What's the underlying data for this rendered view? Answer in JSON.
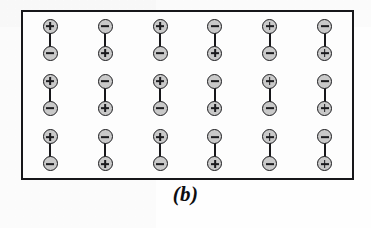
{
  "figure": {
    "caption": "(b)",
    "slab": {
      "border_color": "#17171a",
      "fill_color": "#fdfdfd"
    },
    "charge_style": {
      "fill_color": "#c9c9c9",
      "outline_color": "#1b1b1e",
      "plus_symbol": "+",
      "minus_symbol": "-"
    },
    "grid": {
      "columns": 6,
      "rows": 3
    },
    "dipole_rows": [
      [
        {
          "top": "plus",
          "bottom": "minus"
        },
        {
          "top": "minus",
          "bottom": "plus"
        },
        {
          "top": "plus",
          "bottom": "minus"
        },
        {
          "top": "minus",
          "bottom": "plus"
        },
        {
          "top": "plus",
          "bottom": "minus"
        },
        {
          "top": "minus",
          "bottom": "plus"
        }
      ],
      [
        {
          "top": "plus",
          "bottom": "minus"
        },
        {
          "top": "minus",
          "bottom": "plus"
        },
        {
          "top": "plus",
          "bottom": "minus"
        },
        {
          "top": "minus",
          "bottom": "plus"
        },
        {
          "top": "plus",
          "bottom": "minus"
        },
        {
          "top": "minus",
          "bottom": "plus"
        }
      ],
      [
        {
          "top": "plus",
          "bottom": "minus"
        },
        {
          "top": "minus",
          "bottom": "plus"
        },
        {
          "top": "plus",
          "bottom": "minus"
        },
        {
          "top": "minus",
          "bottom": "plus"
        },
        {
          "top": "plus",
          "bottom": "minus"
        },
        {
          "top": "minus",
          "bottom": "plus"
        }
      ]
    ]
  }
}
